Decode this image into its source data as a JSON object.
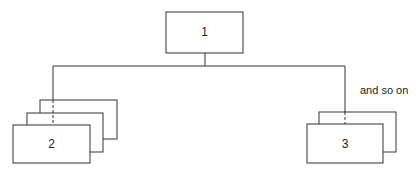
{
  "nodes": {
    "root": {
      "label": "1"
    },
    "left": {
      "label": "2"
    },
    "right": {
      "label": "3"
    }
  },
  "annotation": "and so on",
  "colors": {
    "line": "#333333",
    "background": "#ffffff"
  }
}
